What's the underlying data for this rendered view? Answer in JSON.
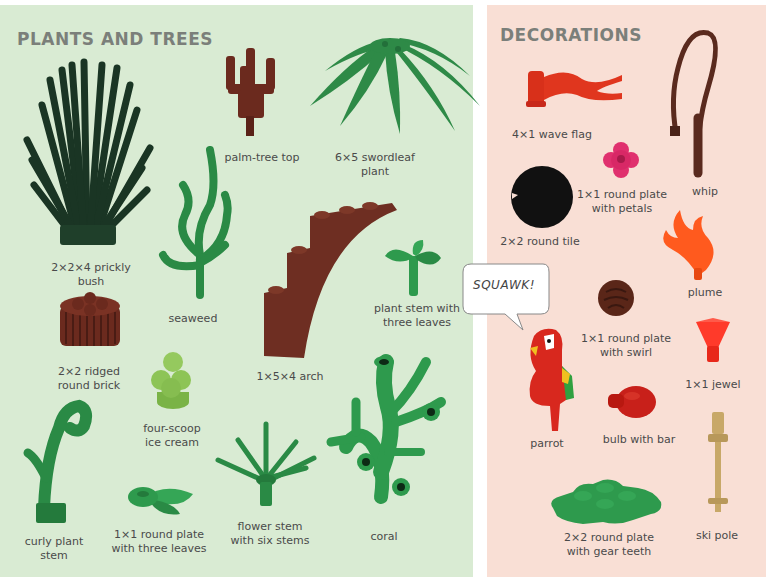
{
  "sections": {
    "plants": {
      "title": "PLANTS AND TREES",
      "background": "#d9ebd3",
      "items": [
        {
          "name": "prickly-bush",
          "label": [
            "2×2×4 prickly",
            "bush"
          ],
          "color": "#1e3a28"
        },
        {
          "name": "palm-tree-top",
          "label": [
            "palm-tree top"
          ],
          "color": "#6b2a1e"
        },
        {
          "name": "swordleaf-plant",
          "label": [
            "6×5 swordleaf",
            "plant"
          ],
          "color": "#2e8a47"
        },
        {
          "name": "seaweed",
          "label": [
            "seaweed"
          ],
          "color": "#2a8a45"
        },
        {
          "name": "ridged-round-brick",
          "label": [
            "2×2 ridged",
            "round brick"
          ],
          "color": "#6b2a1e"
        },
        {
          "name": "arch",
          "label": [
            "1×5×4 arch"
          ],
          "color": "#6e2e22"
        },
        {
          "name": "plant-stem-three-leaves",
          "label": [
            "plant stem with",
            "three leaves"
          ],
          "color": "#2e9a4d"
        },
        {
          "name": "four-scoop-ice-cream",
          "label": [
            "four-scoop",
            "ice cream"
          ],
          "color": "#8dc456"
        },
        {
          "name": "curly-plant-stem",
          "label": [
            "curly plant",
            "stem"
          ],
          "color": "#2a8a45"
        },
        {
          "name": "round-plate-three-leaves",
          "label": [
            "1×1 round plate",
            "with three leaves"
          ],
          "color": "#2e9a4d"
        },
        {
          "name": "flower-stem-six-stems",
          "label": [
            "flower stem",
            "with six stems"
          ],
          "color": "#2a8a45"
        },
        {
          "name": "coral",
          "label": [
            "coral"
          ],
          "color": "#2e9a4d"
        }
      ]
    },
    "decorations": {
      "title": "DECORATIONS",
      "background": "#f9dfd5",
      "items": [
        {
          "name": "wave-flag",
          "label": [
            "4×1 wave flag"
          ],
          "color": "#e0361e"
        },
        {
          "name": "whip",
          "label": [
            "whip"
          ],
          "color": "#5a2a1e"
        },
        {
          "name": "round-plate-petals",
          "label": [
            "1×1 round plate",
            "with petals"
          ],
          "color": "#e0306e"
        },
        {
          "name": "round-tile",
          "label": [
            "2×2 round tile"
          ],
          "color": "#111111"
        },
        {
          "name": "plume",
          "label": [
            "plume"
          ],
          "color": "#ff5a1e"
        },
        {
          "name": "round-plate-swirl",
          "label": [
            "1×1 round plate",
            "with swirl"
          ],
          "color": "#5a2618"
        },
        {
          "name": "jewel",
          "label": [
            "1×1 jewel"
          ],
          "color": "#ff3a2a"
        },
        {
          "name": "parrot",
          "label": [
            "parrot"
          ],
          "color": "#d8281e"
        },
        {
          "name": "bulb-with-bar",
          "label": [
            "bulb with bar"
          ],
          "color": "#c8201a"
        },
        {
          "name": "round-plate-gear-teeth",
          "label": [
            "2×2 round plate",
            "with gear teeth"
          ],
          "color": "#2e9a4d"
        },
        {
          "name": "ski-pole",
          "label": [
            "ski pole"
          ],
          "color": "#c8a868"
        }
      ],
      "speech_bubble": "SQUAWK!"
    }
  }
}
